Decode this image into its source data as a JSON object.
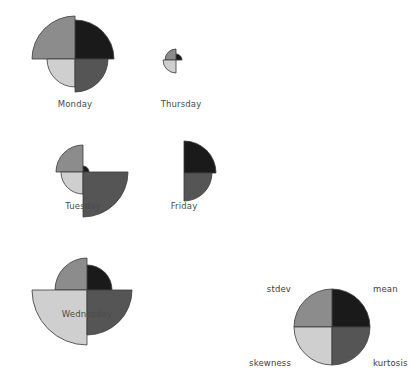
{
  "figure": {
    "background_color": "#ffffff",
    "label_color": "#4b4b4b",
    "outline_color": "#3a3a3a"
  },
  "chart_data": {
    "type": "pie",
    "variant": "star-glyph / four-fold segment plot",
    "title": "",
    "xlabel": "",
    "ylabel": "",
    "grid": false,
    "legend_position": "bottom-right",
    "sector_order": [
      "mean",
      "stdev",
      "skewness",
      "kurtosis"
    ],
    "sector_angles_deg": {
      "mean": [
        0,
        90
      ],
      "stdev": [
        90,
        180
      ],
      "skewness": [
        180,
        270
      ],
      "kurtosis": [
        270,
        360
      ]
    },
    "sector_colors": {
      "mean": "#1a1a1a",
      "stdev": "#8c8c8c",
      "skewness": "#cfcfcf",
      "kurtosis": "#555555"
    },
    "radius_unit": "px",
    "max_radius": 55,
    "glyphs": [
      {
        "name": "Monday",
        "cx": 75,
        "cy": 59,
        "radii": {
          "mean": 39,
          "stdev": 43,
          "skewness": 28,
          "kurtosis": 33
        },
        "values": {
          "mean": 0.71,
          "stdev": 0.78,
          "skewness": 0.51,
          "kurtosis": 0.6
        }
      },
      {
        "name": "Tuesday",
        "cx": 83,
        "cy": 172,
        "radii": {
          "mean": 6,
          "stdev": 27,
          "skewness": 22,
          "kurtosis": 45
        },
        "values": {
          "mean": 0.11,
          "stdev": 0.49,
          "skewness": 0.4,
          "kurtosis": 0.82
        }
      },
      {
        "name": "Wednesday",
        "cx": 87,
        "cy": 290,
        "radii": {
          "mean": 25,
          "stdev": 32,
          "skewness": 55,
          "kurtosis": 45
        },
        "values": {
          "mean": 0.45,
          "stdev": 0.58,
          "skewness": 1.0,
          "kurtosis": 0.82
        }
      },
      {
        "name": "Thursday",
        "cx": 176,
        "cy": 60,
        "radii": {
          "mean": 6,
          "stdev": 11,
          "skewness": 13,
          "kurtosis": 0
        },
        "values": {
          "mean": 0.11,
          "stdev": 0.2,
          "skewness": 0.24,
          "kurtosis": 0.0
        }
      },
      {
        "name": "Friday",
        "cx": 184,
        "cy": 173,
        "radii": {
          "mean": 32,
          "stdev": 0,
          "skewness": 0,
          "kurtosis": 28
        },
        "values": {
          "mean": 0.58,
          "stdev": 0.0,
          "skewness": 0.0,
          "kurtosis": 0.51
        }
      }
    ],
    "legend_glyph": {
      "cx": 332,
      "cy": 327,
      "radius": 38,
      "labels": [
        {
          "key": "mean",
          "text": "mean",
          "x": 373,
          "y": 290,
          "align": "start"
        },
        {
          "key": "stdev",
          "text": "stdev",
          "x": 291,
          "y": 290,
          "align": "end"
        },
        {
          "key": "skewness",
          "text": "skewness",
          "x": 291,
          "y": 364,
          "align": "end"
        },
        {
          "key": "kurtosis",
          "text": "kurtosis",
          "x": 373,
          "y": 364,
          "align": "start"
        }
      ]
    }
  },
  "labels": {
    "monday": {
      "text": "Monday",
      "x": 75,
      "y": 104
    },
    "tuesday": {
      "text": "Tuesday",
      "x": 83,
      "y": 206
    },
    "wednesday": {
      "text": "Wednesday",
      "x": 87,
      "y": 314
    },
    "thursday": {
      "text": "Thursday",
      "x": 181,
      "y": 104
    },
    "friday": {
      "text": "Friday",
      "x": 184,
      "y": 206
    }
  },
  "legend_text": {
    "mean": "mean",
    "stdev": "stdev",
    "skewness": "skewness",
    "kurtosis": "kurtosis"
  }
}
